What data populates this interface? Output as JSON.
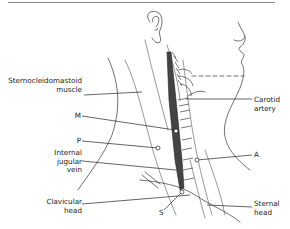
{
  "figure": {
    "page_mark": "",
    "labels": {
      "scm": [
        "Sternocleidomastoid",
        "muscle"
      ],
      "carotid": [
        "Carotid",
        "artery"
      ],
      "m": "M",
      "p": "P",
      "ijv": [
        "Internal",
        "jugular",
        "vein"
      ],
      "a": "A",
      "clavicular": [
        "Clavicular",
        "head"
      ],
      "s": "S",
      "sternal": [
        "Sternal",
        "head"
      ]
    },
    "colors": {
      "ink": "#222222",
      "rule": "#888888",
      "background": "#ffffff"
    }
  }
}
